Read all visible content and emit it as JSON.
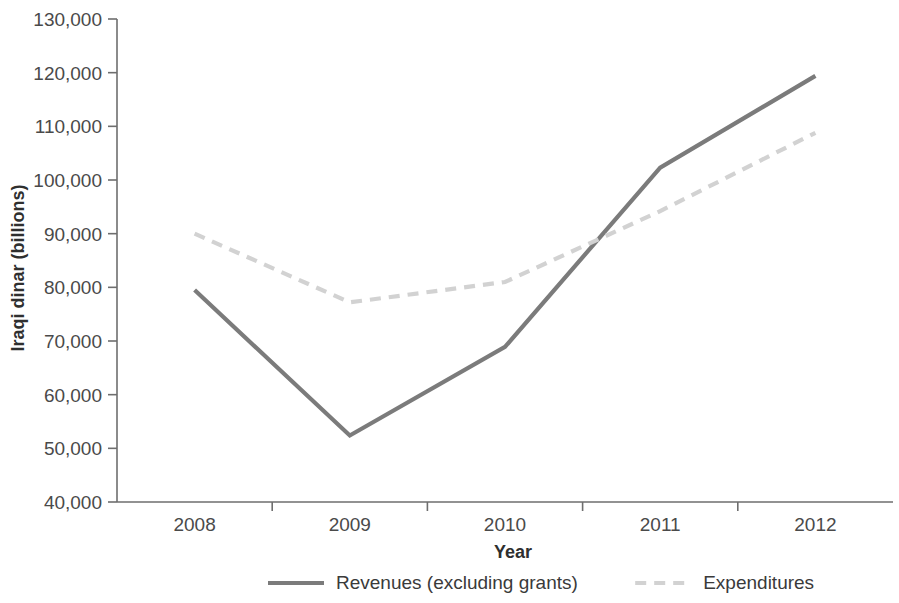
{
  "chart_data": {
    "type": "line",
    "title": "",
    "xlabel": "Year",
    "ylabel": "Iraqi dinar (billions)",
    "categories": [
      "2008",
      "2009",
      "2010",
      "2011",
      "2012"
    ],
    "x_tick_labels": [
      "2008",
      "2009",
      "2010",
      "2011",
      "2012"
    ],
    "y_tick_labels": [
      "40,000",
      "50,000",
      "60,000",
      "70,000",
      "80,000",
      "90,000",
      "100,000",
      "110,000",
      "120,000",
      "130,000"
    ],
    "y_tick_values": [
      40000,
      50000,
      60000,
      70000,
      80000,
      90000,
      100000,
      110000,
      120000,
      130000
    ],
    "ylim": [
      40000,
      130000
    ],
    "grid": false,
    "legend_position": "bottom",
    "series": [
      {
        "name": "Revenues (excluding grants)",
        "values": [
          79500,
          52400,
          68900,
          102300,
          119400
        ],
        "color": "#7b7b7b",
        "style": "solid"
      },
      {
        "name": "Expenditures",
        "values": [
          90000,
          77200,
          81000,
          94200,
          108800
        ],
        "color": "#d2d2d2",
        "style": "dashed"
      }
    ]
  },
  "legend": {
    "items": [
      {
        "label": "Revenues (excluding grants)",
        "color": "#7b7b7b",
        "style": "solid"
      },
      {
        "label": "Expenditures",
        "color": "#d2d2d2",
        "style": "dashed"
      }
    ]
  },
  "axes": {
    "y_title": "Iraqi dinar (billions)",
    "x_title": "Year"
  }
}
